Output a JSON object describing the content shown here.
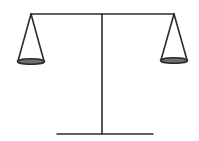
{
  "diagram": {
    "type": "balance-scale",
    "colors": {
      "stroke": "#2b2b2b",
      "pan_fill": "#6e6e6e",
      "background": "#ffffff"
    },
    "beam": {
      "x1": 31,
      "y1": 14,
      "x2": 173,
      "y2": 14
    },
    "post": {
      "x1": 102,
      "y1": 14,
      "x2": 102,
      "y2": 134
    },
    "base": {
      "x1": 57,
      "y1": 134,
      "x2": 153,
      "y2": 134
    },
    "pans": [
      {
        "side": "left",
        "apex": [
          31,
          14
        ],
        "cx": 31,
        "cy": 61,
        "rx": 14,
        "ry": 3
      },
      {
        "side": "right",
        "apex": [
          174,
          14
        ],
        "cx": 174,
        "cy": 60,
        "rx": 14,
        "ry": 3
      }
    ]
  }
}
